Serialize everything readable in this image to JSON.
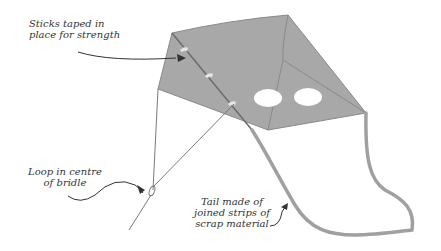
{
  "diagram": {
    "colors": {
      "sail": "#a8a8a8",
      "edge": "#888888",
      "line": "#7a7a7a",
      "text": "#333333",
      "tape": "#e8e8e8",
      "background": "#ffffff"
    },
    "annotations": [
      {
        "id": "sticks",
        "text": "Sticks taped in\nplace for strength"
      },
      {
        "id": "loop",
        "text": "Loop in centre\nof bridle"
      },
      {
        "id": "tail",
        "text": "Tail made of\njoined strips of\nscrap material"
      }
    ]
  }
}
